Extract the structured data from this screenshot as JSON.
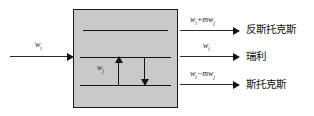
{
  "diagram": {
    "medium": {
      "name": "scattering-medium",
      "fill_color": "#c9c9c9",
      "border_color": "#1a1a1a"
    },
    "energy_levels": [
      {
        "id": "virtual",
        "label": ""
      },
      {
        "id": "upper",
        "label": ""
      },
      {
        "id": "ground",
        "label": ""
      }
    ],
    "internal_transition": {
      "formula_html": "w<sub>j</sub>",
      "up_arrow": "absorption",
      "down_arrow": "emission"
    },
    "incident": {
      "formula_html": "w<sub>i</sub>"
    },
    "outputs": [
      {
        "id": "anti-stokes",
        "formula_html": "w<sub>i</sub>+mw<sub>j</sub>",
        "label": "反斯托克斯"
      },
      {
        "id": "rayleigh",
        "formula_html": "w<sub>i</sub>",
        "label": "瑞利"
      },
      {
        "id": "stokes",
        "formula_html": "w<sub>i</sub>−mw<sub>j</sub>",
        "label": "斯托克斯"
      }
    ]
  }
}
